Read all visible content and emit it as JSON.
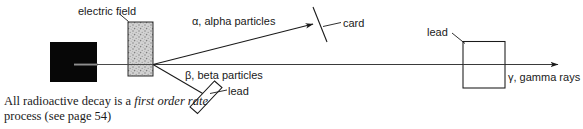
{
  "figure": {
    "labels": {
      "electric_field": "electric field",
      "alpha": "α, alpha particles",
      "beta": "β, beta particles",
      "gamma": "γ, gamma rays",
      "card": "card",
      "lead_right": "lead",
      "lead_beta": "lead"
    },
    "caption": {
      "part1": "All radioactive decay is a ",
      "emphasis": "first order rate",
      "part2": " process (see page 54)"
    },
    "colors": {
      "ink": "#1a1a1a",
      "line": "#222222",
      "source_block": "#050505",
      "plate_fill": "#c9c9c9",
      "background": "#ffffff"
    },
    "elements": {
      "source_block_name": "radioactive source lead block",
      "plate_name": "electric field plates",
      "card_name": "card detector",
      "lead_beta_name": "lead plate stopping beta particles",
      "lead_right_name": "lead block stopping gamma rays"
    }
  }
}
